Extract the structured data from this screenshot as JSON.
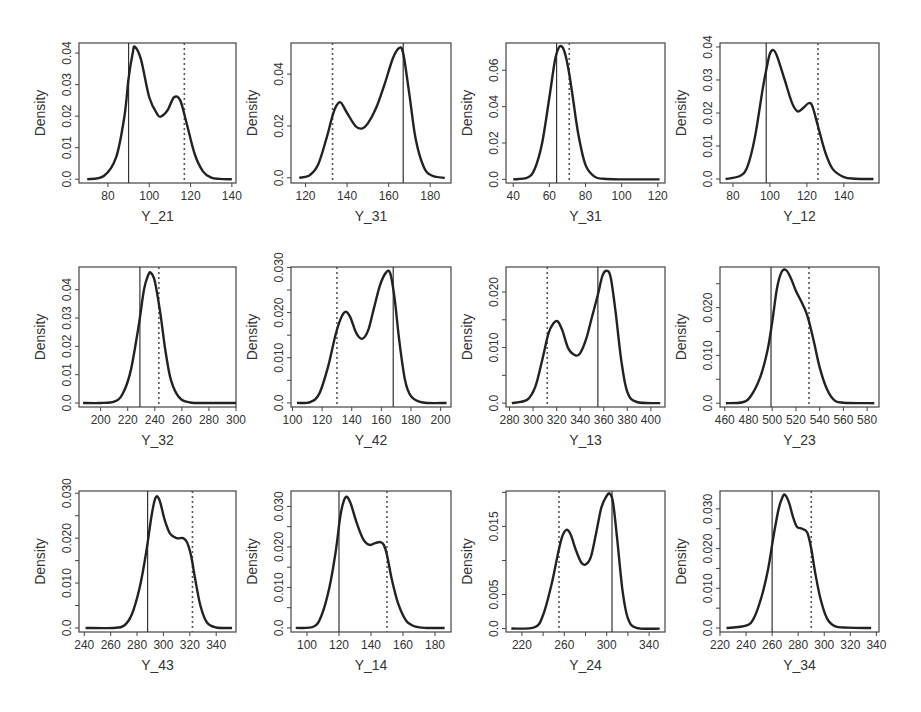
{
  "figure": {
    "rows": 3,
    "cols": 4,
    "ylabel": "Density",
    "line_color": "#222222",
    "legend_note": "solid vertical line and dotted vertical line mark reference values"
  },
  "chart_data": [
    {
      "type": "line",
      "title": "",
      "xlabel": "Y_21",
      "ylabel": "Density",
      "xlim": [
        66,
        142
      ],
      "ylim": [
        -0.0012,
        0.0432
      ],
      "xticks": [
        80,
        100,
        120,
        140
      ],
      "xtick_labels": [
        "80",
        "100",
        "120",
        "140"
      ],
      "yticks": [
        0,
        0.01,
        0.02,
        0.03,
        0.04
      ],
      "ytick_labels": [
        "0.0",
        "0.01",
        "0.02",
        "0.03",
        "0.04"
      ],
      "solid_line": 90,
      "dotted_line": 117,
      "x": [
        70,
        78,
        84,
        88,
        90,
        92,
        93,
        96,
        100,
        104,
        106,
        109,
        112,
        115,
        118,
        122,
        126,
        130,
        134,
        140
      ],
      "y": [
        0,
        0.001,
        0.007,
        0.02,
        0.032,
        0.04,
        0.042,
        0.038,
        0.026,
        0.0205,
        0.02,
        0.022,
        0.026,
        0.025,
        0.018,
        0.008,
        0.0025,
        0.0005,
        0.0001,
        0
      ]
    },
    {
      "type": "line",
      "title": "",
      "xlabel": "Y_31",
      "ylabel": "Density",
      "xlim": [
        113,
        190
      ],
      "ylim": [
        -0.002,
        0.052
      ],
      "xticks": [
        120,
        140,
        160,
        180
      ],
      "xtick_labels": [
        "120",
        "140",
        "160",
        "180"
      ],
      "yticks": [
        0,
        0.02,
        0.04
      ],
      "extra_yticks": [
        0.02
      ],
      "ytick_labels": [
        "0.0",
        "0.02",
        "0.04"
      ],
      "ytick_labels_raw": [
        "0.0",
        "0.02",
        "0.02",
        "0.04"
      ],
      "solid_line": 167,
      "dotted_line": 133,
      "x": [
        117,
        122,
        126,
        130,
        133,
        135,
        137,
        140,
        144,
        147,
        150,
        154,
        158,
        162,
        165,
        167,
        170,
        173,
        177,
        181,
        187
      ],
      "y": [
        0,
        0.001,
        0.005,
        0.015,
        0.024,
        0.028,
        0.029,
        0.025,
        0.02,
        0.019,
        0.021,
        0.027,
        0.036,
        0.046,
        0.05,
        0.048,
        0.032,
        0.015,
        0.004,
        0.0008,
        0
      ]
    },
    {
      "type": "line",
      "title": "",
      "xlabel": "Y_31",
      "ylabel": "Density",
      "xlim": [
        36,
        124
      ],
      "ylim": [
        -0.002,
        0.075
      ],
      "xticks": [
        40,
        60,
        80,
        100,
        120
      ],
      "xtick_labels": [
        "40",
        "60",
        "80",
        "100",
        "120"
      ],
      "yticks": [
        0,
        0.02,
        0.04,
        0.06
      ],
      "ytick_labels": [
        "0.0",
        "0.02",
        "0.04",
        "0.06"
      ],
      "solid_line": 64,
      "dotted_line": 71,
      "x": [
        40,
        48,
        52,
        56,
        60,
        63,
        65,
        67,
        69,
        71,
        73,
        76,
        80,
        85,
        90,
        100,
        121
      ],
      "y": [
        0,
        0.001,
        0.006,
        0.02,
        0.045,
        0.065,
        0.072,
        0.073,
        0.068,
        0.058,
        0.045,
        0.025,
        0.008,
        0.0015,
        0.0003,
        0,
        0
      ]
    },
    {
      "type": "line",
      "title": "",
      "xlabel": "Y_12",
      "ylabel": "Density",
      "xlim": [
        73,
        159
      ],
      "ylim": [
        -0.0012,
        0.0412
      ],
      "xticks": [
        80,
        100,
        120,
        140
      ],
      "xtick_labels": [
        "80",
        "100",
        "120",
        "140"
      ],
      "yticks": [
        0,
        0.01,
        0.02,
        0.03,
        0.04
      ],
      "ytick_labels": [
        "0.0",
        "0.01",
        "0.02",
        "0.03",
        "0.04"
      ],
      "solid_line": 98,
      "dotted_line": 126,
      "x": [
        76,
        84,
        88,
        92,
        96,
        98,
        100,
        102,
        104,
        108,
        112,
        115,
        118,
        121,
        123,
        126,
        130,
        134,
        140,
        146,
        156
      ],
      "y": [
        0,
        0.001,
        0.004,
        0.013,
        0.027,
        0.033,
        0.038,
        0.039,
        0.037,
        0.03,
        0.023,
        0.0205,
        0.0215,
        0.023,
        0.022,
        0.016,
        0.008,
        0.003,
        0.0006,
        0.0001,
        0
      ]
    },
    {
      "type": "line",
      "title": "",
      "xlabel": "Y_32",
      "ylabel": "Density",
      "xlim": [
        184,
        300
      ],
      "ylim": [
        -0.0014,
        0.048
      ],
      "xticks": [
        200,
        220,
        240,
        260,
        280,
        300
      ],
      "xtick_labels": [
        "200",
        "220",
        "240",
        "260",
        "280",
        "300"
      ],
      "yticks": [
        0,
        0.01,
        0.02,
        0.03,
        0.04
      ],
      "ytick_labels": [
        "0.0",
        "0.01",
        "0.02",
        "0.03",
        "0.04"
      ],
      "solid_line": 229,
      "dotted_line": 243,
      "x": [
        187,
        200,
        210,
        216,
        222,
        228,
        232,
        235,
        237,
        240,
        244,
        248,
        252,
        258,
        266,
        280,
        300
      ],
      "y": [
        0,
        0,
        0.0005,
        0.003,
        0.011,
        0.027,
        0.04,
        0.045,
        0.046,
        0.043,
        0.032,
        0.018,
        0.008,
        0.002,
        0.0002,
        0,
        0
      ]
    },
    {
      "type": "line",
      "title": "",
      "xlabel": "Y_42",
      "ylabel": "Density",
      "xlim": [
        99,
        207
      ],
      "ylim": [
        -0.0009,
        0.0301
      ],
      "xticks": [
        100,
        120,
        140,
        160,
        180,
        200
      ],
      "xtick_labels": [
        "100",
        "120",
        "140",
        "160",
        "180",
        "200"
      ],
      "yticks": [
        0,
        0.005,
        0.01,
        0.015,
        0.02,
        0.025,
        0.03
      ],
      "ytick_labels": [
        "0.0",
        "",
        "0.010",
        "",
        "0.020",
        "",
        "0.030"
      ],
      "solid_line": 168,
      "dotted_line": 130,
      "x": [
        103,
        112,
        118,
        124,
        129,
        133,
        136,
        139,
        143,
        147,
        151,
        155,
        159,
        163,
        166,
        169,
        172,
        176,
        180,
        188,
        204
      ],
      "y": [
        0,
        0.0002,
        0.002,
        0.008,
        0.015,
        0.019,
        0.0202,
        0.019,
        0.0155,
        0.0142,
        0.016,
        0.021,
        0.026,
        0.0288,
        0.0287,
        0.023,
        0.014,
        0.005,
        0.0015,
        0.0001,
        0
      ]
    },
    {
      "type": "line",
      "title": "",
      "xlabel": "Y_13",
      "ylabel": "Density",
      "xlim": [
        277,
        412
      ],
      "ylim": [
        -0.0007,
        0.0245
      ],
      "xticks": [
        280,
        300,
        320,
        340,
        360,
        380,
        400
      ],
      "xtick_labels": [
        "280",
        "300",
        "320",
        "340",
        "360",
        "380",
        "400"
      ],
      "yticks": [
        0,
        0.005,
        0.01,
        0.015,
        0.02
      ],
      "ytick_labels": [
        "0.0",
        "",
        "0.010",
        "",
        "0.020"
      ],
      "solid_line": 355,
      "dotted_line": 312,
      "x": [
        282,
        295,
        302,
        308,
        313,
        317,
        321,
        325,
        330,
        336,
        340,
        345,
        350,
        355,
        359,
        363,
        366,
        370,
        375,
        380,
        388,
        408
      ],
      "y": [
        0,
        0.0006,
        0.003,
        0.008,
        0.0125,
        0.0143,
        0.0147,
        0.013,
        0.0098,
        0.0086,
        0.009,
        0.0115,
        0.0155,
        0.0195,
        0.023,
        0.0238,
        0.0225,
        0.0165,
        0.0075,
        0.002,
        0.0002,
        0
      ]
    },
    {
      "type": "line",
      "title": "",
      "xlabel": "Y_23",
      "ylabel": "Density",
      "xlim": [
        456,
        590
      ],
      "ylim": [
        -0.0008,
        0.0285
      ],
      "xticks": [
        460,
        480,
        500,
        520,
        540,
        560,
        580
      ],
      "xtick_labels": [
        "460",
        "480",
        "500",
        "520",
        "540",
        "560",
        "580"
      ],
      "yticks": [
        0,
        0.005,
        0.01,
        0.015,
        0.02,
        0.025
      ],
      "ytick_labels": [
        "0.0",
        "",
        "0.010",
        "",
        "0.020",
        ""
      ],
      "solid_line": 499,
      "dotted_line": 531,
      "x": [
        461,
        475,
        482,
        490,
        496,
        500,
        504,
        508,
        512,
        516,
        520,
        526,
        530,
        535,
        540,
        546,
        552,
        560,
        586
      ],
      "y": [
        0,
        0.0002,
        0.0015,
        0.0055,
        0.011,
        0.017,
        0.024,
        0.0275,
        0.0278,
        0.026,
        0.0235,
        0.0205,
        0.018,
        0.013,
        0.0075,
        0.003,
        0.0007,
        0.0001,
        0
      ]
    },
    {
      "type": "line",
      "title": "",
      "xlabel": "Y_43",
      "ylabel": "Density",
      "xlim": [
        236,
        355
      ],
      "ylim": [
        -0.0009,
        0.0305
      ],
      "xticks": [
        240,
        260,
        280,
        300,
        320,
        340
      ],
      "xtick_labels": [
        "240",
        "260",
        "280",
        "300",
        "320",
        "340"
      ],
      "yticks": [
        0,
        0.005,
        0.01,
        0.015,
        0.02,
        0.025,
        0.03
      ],
      "ytick_labels": [
        "0.0",
        "",
        "0.010",
        "",
        "0.020",
        "",
        "0.030"
      ],
      "solid_line": 288,
      "dotted_line": 322,
      "x": [
        241,
        262,
        270,
        276,
        282,
        287,
        291,
        294,
        297,
        301,
        305,
        310,
        315,
        318,
        321,
        324,
        328,
        333,
        340,
        352
      ],
      "y": [
        0,
        0,
        0.0005,
        0.003,
        0.009,
        0.017,
        0.025,
        0.029,
        0.0285,
        0.024,
        0.021,
        0.02,
        0.02,
        0.019,
        0.016,
        0.011,
        0.005,
        0.0012,
        0.0001,
        0
      ]
    },
    {
      "type": "line",
      "title": "",
      "xlabel": "Y_14",
      "ylabel": "Density",
      "xlim": [
        90,
        190
      ],
      "ylim": [
        -0.001,
        0.0338
      ],
      "xticks": [
        100,
        120,
        140,
        160,
        180
      ],
      "xtick_labels": [
        "100",
        "120",
        "140",
        "160",
        "180"
      ],
      "yticks": [
        0,
        0.005,
        0.01,
        0.015,
        0.02,
        0.025,
        0.03
      ],
      "ytick_labels": [
        "0.0",
        "",
        "0.010",
        "",
        "0.020",
        "",
        "0.030"
      ],
      "solid_line": 120,
      "dotted_line": 150,
      "x": [
        93,
        104,
        109,
        114,
        118,
        121,
        124,
        127,
        131,
        135,
        139,
        143,
        146,
        148,
        150,
        153,
        157,
        162,
        168,
        175,
        186
      ],
      "y": [
        0,
        0.0003,
        0.003,
        0.01,
        0.019,
        0.028,
        0.0322,
        0.031,
        0.026,
        0.022,
        0.0205,
        0.021,
        0.0212,
        0.0205,
        0.018,
        0.012,
        0.006,
        0.0018,
        0.0003,
        0,
        0
      ]
    },
    {
      "type": "line",
      "title": "",
      "xlabel": "Y_24",
      "ylabel": "Density",
      "xlim": [
        205,
        355
      ],
      "ylim": [
        -0.0005,
        0.0202
      ],
      "xticks": [
        220,
        240,
        260,
        280,
        300,
        320,
        340
      ],
      "xtick_labels": [
        "220",
        "",
        "260",
        "",
        "300",
        "",
        "340"
      ],
      "yticks": [
        0,
        0.005,
        0.01,
        0.015,
        0.02
      ],
      "ytick_labels": [
        "0.0",
        "0.005",
        "",
        "0.015",
        ""
      ],
      "solid_line": 305,
      "dotted_line": 255,
      "x": [
        210,
        232,
        240,
        248,
        254,
        258,
        262,
        266,
        271,
        276,
        280,
        285,
        290,
        295,
        300,
        303,
        306,
        310,
        315,
        320,
        328,
        350
      ],
      "y": [
        0,
        0.0002,
        0.002,
        0.0065,
        0.011,
        0.0135,
        0.0145,
        0.0138,
        0.0115,
        0.0097,
        0.0094,
        0.0105,
        0.014,
        0.0178,
        0.0195,
        0.0198,
        0.0185,
        0.013,
        0.0055,
        0.0015,
        0.0001,
        0
      ]
    },
    {
      "type": "line",
      "title": "",
      "xlabel": "Y_34",
      "ylabel": "Density",
      "xlim": [
        220,
        342
      ],
      "ylim": [
        -0.001,
        0.0345
      ],
      "xticks": [
        220,
        240,
        260,
        280,
        300,
        320,
        340
      ],
      "xtick_labels": [
        "220",
        "240",
        "260",
        "280",
        "300",
        "320",
        "340"
      ],
      "yticks": [
        0,
        0.005,
        0.01,
        0.015,
        0.02,
        0.025,
        0.03
      ],
      "ytick_labels": [
        "0.0",
        "",
        "0.010",
        "",
        "0.020",
        "",
        "0.030"
      ],
      "solid_line": 260,
      "dotted_line": 290,
      "x": [
        225,
        240,
        246,
        252,
        257,
        261,
        265,
        268,
        270,
        273,
        276,
        279,
        283,
        287,
        290,
        293,
        297,
        302,
        308,
        318,
        336
      ],
      "y": [
        0,
        0.0006,
        0.0025,
        0.008,
        0.015,
        0.023,
        0.03,
        0.033,
        0.0335,
        0.0315,
        0.028,
        0.0255,
        0.025,
        0.024,
        0.02,
        0.014,
        0.0075,
        0.0025,
        0.0005,
        0.0001,
        0
      ]
    }
  ]
}
